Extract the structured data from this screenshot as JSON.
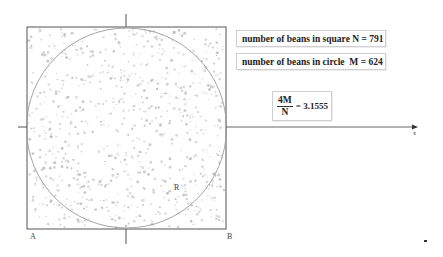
{
  "diagram": {
    "square_label": "number of beans in square",
    "square_var": "N",
    "square_count": "791",
    "circle_label": "number of beans in circle",
    "circle_var": "M",
    "circle_count": "624",
    "formula": {
      "numerator": "4M",
      "denominator": "N",
      "equals": "=",
      "result": "3.1555"
    },
    "points": {
      "corner_a": "A",
      "corner_b": "B",
      "radius_label": "R",
      "x_axis_label": "x"
    },
    "colors": {
      "square_border": "#555555",
      "circle_stroke": "#9a9a9a",
      "bean": "#b8b8b8",
      "axis": "#555555"
    }
  }
}
